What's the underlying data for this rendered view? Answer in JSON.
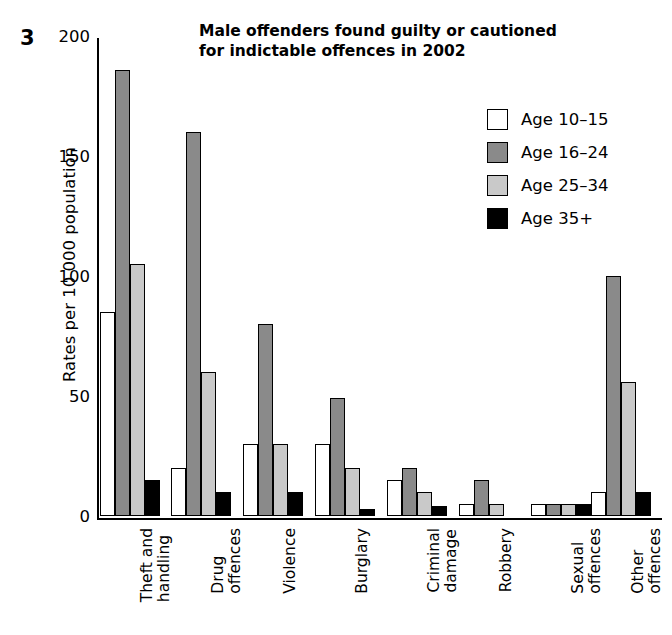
{
  "figure": {
    "number": "3",
    "title_line1": "Male offenders found guilty or cautioned",
    "title_line2": "for indictable offences in 2002"
  },
  "axes": {
    "ylabel": "Rates per 10 000 population",
    "yticks": [
      "0",
      "50",
      "100",
      "150",
      "200"
    ]
  },
  "legend": {
    "items": [
      {
        "label": "Age 10–15",
        "color": "#ffffff"
      },
      {
        "label": "Age 16–24",
        "color": "#8a8a8a"
      },
      {
        "label": "Age 25–34",
        "color": "#c9c9c9"
      },
      {
        "label": "Age 35+",
        "color": "#000000"
      }
    ]
  },
  "chart_data": {
    "type": "bar",
    "title": "Male offenders found guilty or cautioned for indictable offences in 2002",
    "xlabel": "",
    "ylabel": "Rates per 10 000 population",
    "ylim": [
      0,
      200
    ],
    "yticks": [
      0,
      50,
      100,
      150,
      200
    ],
    "grid": false,
    "legend_position": "upper-right",
    "categories": [
      "Theft and handling",
      "Drug offences",
      "Violence",
      "Burglary",
      "Criminal damage",
      "Robbery",
      "Sexual offences",
      "Other offences"
    ],
    "category_lines": [
      [
        "Theft and",
        "handling"
      ],
      [
        "Drug",
        "offences"
      ],
      [
        "Violence"
      ],
      [
        "Burglary"
      ],
      [
        "Criminal",
        "damage"
      ],
      [
        "Robbery"
      ],
      [
        "Sexual",
        "offences"
      ],
      [
        "Other",
        "offences"
      ]
    ],
    "series": [
      {
        "name": "Age 10–15",
        "color": "#ffffff",
        "values": [
          85,
          20,
          30,
          30,
          15,
          5,
          5,
          10
        ]
      },
      {
        "name": "Age 16–24",
        "color": "#8a8a8a",
        "values": [
          186,
          160,
          80,
          49,
          20,
          15,
          5,
          100
        ]
      },
      {
        "name": "Age 25–34",
        "color": "#c9c9c9",
        "values": [
          105,
          60,
          30,
          20,
          10,
          5,
          5,
          56
        ]
      },
      {
        "name": "Age 35+",
        "color": "#000000",
        "values": [
          15,
          10,
          10,
          3,
          4,
          0,
          5,
          10
        ]
      }
    ]
  }
}
